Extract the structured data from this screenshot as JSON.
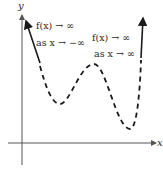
{
  "diagram": {
    "type": "function-end-behavior-graph",
    "axes": {
      "x_label": "x",
      "y_label": "y"
    },
    "annotations": {
      "left": {
        "line1": "f(x) → ∞",
        "line2": "as x → −∞"
      },
      "right": {
        "line1": "f(x) → ∞",
        "line2": "as x → ∞"
      }
    },
    "curve": {
      "style": "dashed",
      "end_arrows": "solid",
      "color": "#1a1a1a",
      "shape": "W-shaped quartic: rises to infinity at both ends, two local minima and one local maximum"
    },
    "colors": {
      "axis": "#555555",
      "curve": "#1a1a1a",
      "text": "#2a2a2a",
      "background": "#ffffff"
    }
  }
}
